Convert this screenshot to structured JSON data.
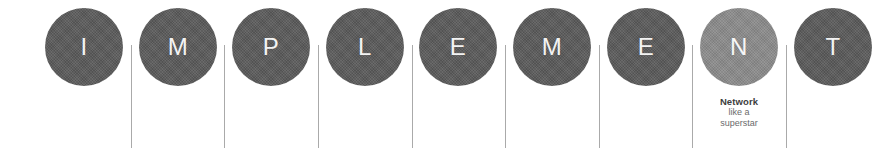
{
  "graphic": {
    "word": "IMPLEMENT",
    "background_color": "#ffffff",
    "node_color": "#595959",
    "highlight_color": "#8a8a8a",
    "letter_color": "#ffffff",
    "divider_color": "#9b9b9b",
    "nodes": [
      {
        "letter": "I",
        "highlighted": false
      },
      {
        "letter": "M",
        "highlighted": false
      },
      {
        "letter": "P",
        "highlighted": false
      },
      {
        "letter": "L",
        "highlighted": false
      },
      {
        "letter": "E",
        "highlighted": false
      },
      {
        "letter": "M",
        "highlighted": false
      },
      {
        "letter": "E",
        "highlighted": false
      },
      {
        "letter": "N",
        "highlighted": true
      },
      {
        "letter": "T",
        "highlighted": false
      }
    ],
    "caption": {
      "title": "Network",
      "line1": "like a",
      "line2": "superstar"
    }
  }
}
